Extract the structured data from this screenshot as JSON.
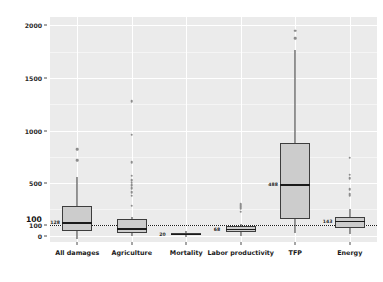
{
  "chart_data": {
    "type": "box",
    "title": "",
    "xlabel": "",
    "ylabel": "Macro impacts (% relative to direct impacts)",
    "ylim": [
      -60,
      2080
    ],
    "yticks": [
      0,
      100,
      500,
      1000,
      1500,
      2000
    ],
    "ytick_labels": [
      "0",
      "100",
      "500",
      "1000",
      "1500",
      "2000"
    ],
    "grid": true,
    "legend": "none",
    "reference_line": {
      "value": 100,
      "label": "100",
      "style": "dotted"
    },
    "categories": [
      "All damages",
      "Agriculture",
      "Mortality",
      "Labor productivity",
      "TFP",
      "Energy"
    ],
    "boxes": [
      {
        "category": "All damages",
        "lower_whisker": -35,
        "q1": 45,
        "median": 128,
        "q3": 280,
        "upper_whisker": 560,
        "median_label": "128",
        "outliers": [
          720,
          820
        ]
      },
      {
        "category": "Agriculture",
        "lower_whisker": 0,
        "q1": 30,
        "median": 70,
        "q3": 155,
        "upper_whisker": 175,
        "median_label": "",
        "outliers": [
          285,
          380,
          415,
          450,
          480,
          505,
          530,
          570,
          700,
          960,
          1280
        ]
      },
      {
        "category": "Mortality",
        "lower_whisker": -10,
        "q1": 5,
        "median": 20,
        "q3": 30,
        "upper_whisker": 40,
        "median_label": "20",
        "outliers": []
      },
      {
        "category": "Labor productivity",
        "lower_whisker": -5,
        "q1": 35,
        "median": 68,
        "q3": 95,
        "upper_whisker": 110,
        "median_label": "68",
        "outliers": [
          230,
          255,
          270,
          290,
          305
        ]
      },
      {
        "category": "TFP",
        "lower_whisker": 25,
        "q1": 160,
        "median": 488,
        "q3": 880,
        "upper_whisker": 1770,
        "median_label": "488",
        "outliers": [
          1880,
          1950
        ]
      },
      {
        "category": "Energy",
        "lower_whisker": 15,
        "q1": 75,
        "median": 143,
        "q3": 175,
        "upper_whisker": 255,
        "median_label": "143",
        "outliers": [
          380,
          395,
          440,
          545,
          580,
          740
        ]
      }
    ]
  },
  "style": {
    "panel_fill": "#ebebeb",
    "grid_color": "#ffffff",
    "box_fill": "#cccccc",
    "box_stroke": "#3d3d3d",
    "outlier_color": "#8c8c8c",
    "text_color": "#1a1a1a"
  }
}
